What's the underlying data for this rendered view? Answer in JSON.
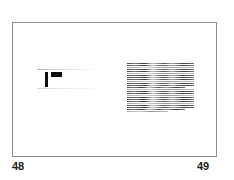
{
  "document": {
    "type": "scanned-book-spread",
    "background_color": "#ffffff",
    "frame_color": "#8c8c8c"
  },
  "left_page": {
    "folio": "48",
    "content_note": "faded-text-fragment",
    "heading_mark_color": "#0d0d0d",
    "rule_count": 2
  },
  "right_page": {
    "folio": "49",
    "content_note": "dense-body-text-block",
    "ink_color": "#282828",
    "line_count": 25,
    "lines": [
      {
        "width": "full",
        "tone": "dark"
      },
      {
        "width": "full",
        "tone": "dark"
      },
      {
        "width": "full",
        "tone": "pale"
      },
      {
        "width": "full",
        "tone": "dark"
      },
      {
        "width": "full",
        "tone": "dark"
      },
      {
        "width": "full",
        "tone": "pale"
      },
      {
        "width": "full",
        "tone": "dark"
      },
      {
        "width": "full",
        "tone": "dark"
      },
      {
        "width": "full",
        "tone": "dark"
      },
      {
        "width": "full",
        "tone": "pale"
      },
      {
        "width": "full",
        "tone": "dark"
      },
      {
        "width": "full",
        "tone": "dark"
      },
      {
        "width": "short",
        "tone": "dark"
      },
      {
        "width": "full",
        "tone": "pale"
      },
      {
        "width": "full",
        "tone": "dark"
      },
      {
        "width": "full",
        "tone": "dark"
      },
      {
        "width": "full",
        "tone": "pale"
      },
      {
        "width": "full",
        "tone": "dark"
      },
      {
        "width": "full",
        "tone": "dark"
      },
      {
        "width": "full",
        "tone": "dark"
      },
      {
        "width": "full",
        "tone": "pale"
      },
      {
        "width": "full",
        "tone": "dark"
      },
      {
        "width": "full",
        "tone": "dark"
      },
      {
        "width": "short",
        "tone": "dark"
      },
      {
        "width": "xshort",
        "tone": "pale"
      }
    ]
  }
}
